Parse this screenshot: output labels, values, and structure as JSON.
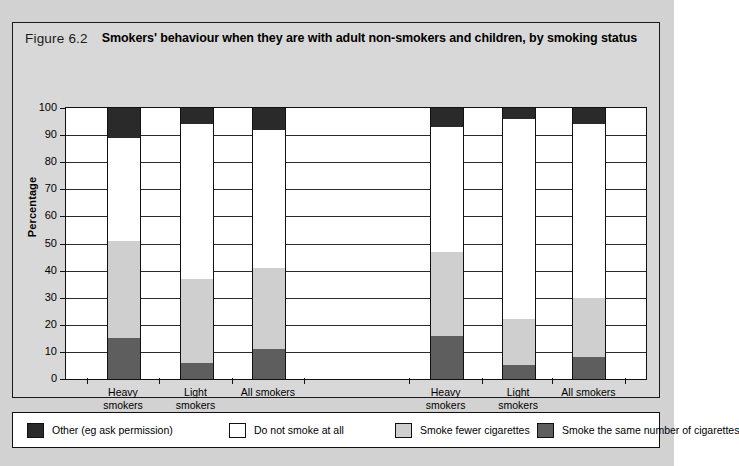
{
  "figure": {
    "number": "Figure 6.2",
    "title": "Smokers' behaviour when they are with adult non-smokers and children, by smoking status"
  },
  "chart_data": {
    "type": "bar",
    "subtype": "stacked-percentage",
    "title": "Smokers' behaviour when they are with adult non-smokers and children, by smoking status",
    "xlabel": "",
    "ylabel": "Percentage",
    "ylim": [
      0,
      100
    ],
    "ytick_step": 10,
    "yticks": [
      0,
      10,
      20,
      30,
      40,
      50,
      60,
      70,
      80,
      90,
      100
    ],
    "grid": true,
    "legend_position": "bottom",
    "groups": [
      "Adult non-smokers",
      "Children"
    ],
    "categories": [
      "Heavy smokers",
      "Light smokers",
      "All smokers"
    ],
    "series": [
      {
        "name": "Smoke the same number of cigarettes",
        "color": "#5e5e5e",
        "stack_order": 1,
        "values": {
          "Adult non-smokers": [
            15,
            6,
            11
          ],
          "Children": [
            16,
            5,
            8
          ]
        }
      },
      {
        "name": "Smoke fewer cigarettes",
        "color": "#cfcfcf",
        "stack_order": 2,
        "values": {
          "Adult non-smokers": [
            36,
            31,
            30
          ],
          "Children": [
            31,
            17,
            22
          ]
        }
      },
      {
        "name": "Do not smoke at all",
        "color": "#ffffff",
        "stack_order": 3,
        "values": {
          "Adult non-smokers": [
            38,
            57,
            51
          ],
          "Children": [
            46,
            74,
            64
          ]
        }
      },
      {
        "name": "Other (eg ask permission)",
        "color": "#2a2a2a",
        "stack_order": 4,
        "values": {
          "Adult non-smokers": [
            11,
            6,
            8
          ],
          "Children": [
            7,
            4,
            6
          ]
        }
      }
    ],
    "cumulative_tops": {
      "Adult non-smokers": {
        "Heavy smokers": [
          15,
          51,
          89,
          100
        ],
        "Light smokers": [
          6,
          37,
          94,
          100
        ],
        "All smokers": [
          11,
          41,
          92,
          100
        ]
      },
      "Children": {
        "Heavy smokers": [
          16,
          47,
          93,
          100
        ],
        "Light smokers": [
          5,
          22,
          96,
          100
        ],
        "All smokers": [
          8,
          30,
          94,
          100
        ]
      }
    }
  },
  "axis": {
    "y_title": "Percentage",
    "y_labels": [
      "100",
      "90",
      "80",
      "70",
      "60",
      "50",
      "40",
      "30",
      "20",
      "10",
      "0"
    ]
  },
  "x_axis": {
    "groups": [
      {
        "label": "Adult non-smokers",
        "categories": [
          {
            "line1": "Heavy",
            "line2": "smokers"
          },
          {
            "line1": "Light",
            "line2": "smokers"
          },
          {
            "line1": "All smokers",
            "line2": ""
          }
        ]
      },
      {
        "label": "Children",
        "categories": [
          {
            "line1": "Heavy",
            "line2": "smokers"
          },
          {
            "line1": "Light",
            "line2": "smokers"
          },
          {
            "line1": "All smokers",
            "line2": ""
          }
        ]
      }
    ]
  },
  "legend": {
    "items": [
      {
        "label": "Other (eg ask permission)",
        "swatch": "c-black",
        "color": "#2a2a2a"
      },
      {
        "label": "Do not smoke at all",
        "swatch": "c-white",
        "color": "#ffffff"
      },
      {
        "label": "Smoke fewer cigarettes",
        "swatch": "c-light",
        "color": "#cfcfcf"
      },
      {
        "label": "Smoke the same number of cigarettes",
        "swatch": "c-dark",
        "color": "#5e5e5e"
      }
    ]
  }
}
